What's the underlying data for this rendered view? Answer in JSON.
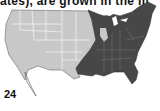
{
  "caption": "ates), are grown in the m",
  "page_number": "24",
  "map": {
    "title": "US map with shaded region",
    "colors": {
      "unshaded": "#c8c8c8",
      "shaded": "#474747",
      "border": "#ffffff",
      "outline": "#555555"
    },
    "shaded_region": "Eastern United States"
  }
}
